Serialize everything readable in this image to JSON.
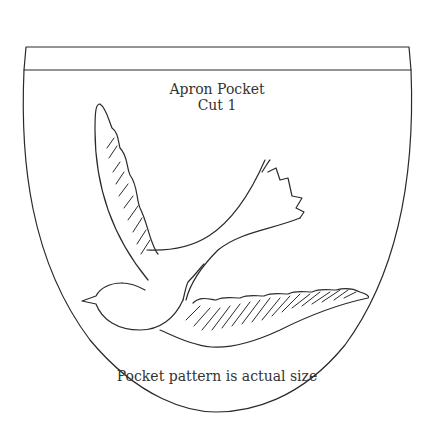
{
  "pattern": {
    "title": "Apron Pocket",
    "cut_instruction": "Cut 1",
    "size_note": "Pocket pattern is actual size",
    "illustration": "bird-in-flight",
    "stroke_color": "#2a2a2a",
    "background_color": "#ffffff"
  }
}
